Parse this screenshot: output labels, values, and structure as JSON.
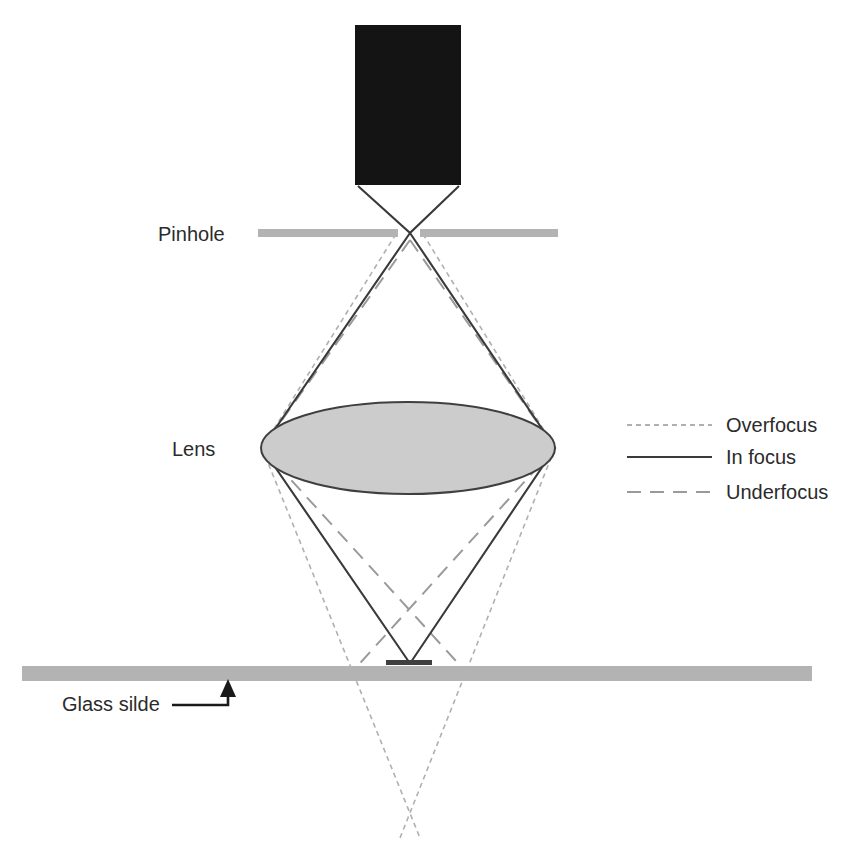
{
  "figure": {
    "type": "optical-ray-diagram",
    "title": "",
    "background_color": "#ffffff"
  },
  "components": {
    "detector": {
      "name": "detector-block",
      "color": "#141414",
      "x": 355,
      "y": 25,
      "width": 106,
      "height": 160
    },
    "pinhole": {
      "label": "Pinhole",
      "label_x": 158,
      "label_y": 241,
      "color": "#b3b3b3",
      "plane_y": 233,
      "left_bar": {
        "x1": 258,
        "x2": 398
      },
      "right_bar": {
        "x1": 420,
        "x2": 558
      }
    },
    "lens": {
      "label": "Lens",
      "label_x": 172,
      "label_y": 456,
      "fill": "#cccccc",
      "stroke": "#3f3f3f",
      "cx": 408,
      "cy": 448,
      "rx": 147,
      "ry": 46
    },
    "glass_slide": {
      "label": "Glass silde",
      "label_x": 62,
      "label_y": 711,
      "color": "#b3b3b3",
      "x1": 22,
      "x2": 812,
      "y": 666,
      "thickness": 15
    },
    "specimen": {
      "name": "specimen-bar",
      "color": "#3f3f3f",
      "x1": 386,
      "x2": 432,
      "y": 663,
      "thickness": 4
    },
    "leader_arrow": {
      "name": "glass-slide-leader",
      "color": "#1a1a1a",
      "from_x": 172,
      "from_y": 705,
      "corner_x": 228,
      "tip_y": 684
    }
  },
  "rays": {
    "in_focus": {
      "label": "In focus",
      "style": "solid",
      "color": "#3a3a3a",
      "width": 2.1,
      "description": "Solid rays from detector corners crossing at the pinhole, through the lens edges, converging to a point on the specimen at the glass slide surface."
    },
    "overfocus": {
      "label": "Overfocus",
      "style": "fine-dash",
      "color": "#b0b0b0",
      "width": 1.6,
      "dash": "5,4",
      "description": "Fine dashed rays starting at the pinhole bar edges, through the lens edges, crossing below the glass slide."
    },
    "underfocus": {
      "label": "Underfocus",
      "style": "long-dash",
      "color": "#9a9a9a",
      "width": 2.0,
      "dash": "14,9",
      "description": "Long dashed rays apexing just below the pinhole, through the lens edges, crossing above the glass slide."
    }
  },
  "legend": {
    "name": "focus-legend",
    "sample_x1": 627,
    "sample_x2": 712,
    "text_x": 726,
    "entries": [
      {
        "label": "Overfocus",
        "y": 425,
        "style": "fine-dash",
        "color": "#b0b0b0"
      },
      {
        "label": "In focus",
        "y": 457,
        "style": "solid",
        "color": "#3a3a3a"
      },
      {
        "label": "Underfocus",
        "y": 492,
        "style": "long-dash",
        "color": "#9a9a9a"
      }
    ]
  },
  "geometry": {
    "optical_axis_x": 410,
    "detector_bottom_y": 185,
    "pinhole_y": 233,
    "lens_left_x": 262,
    "lens_right_x": 555,
    "lens_y": 448,
    "focus_point_y": 662,
    "underfocus_cross_y": 604,
    "overfocus_cross_y": 800,
    "overfocus_bottom_y": 838,
    "underfocus_apex_y": 240
  }
}
